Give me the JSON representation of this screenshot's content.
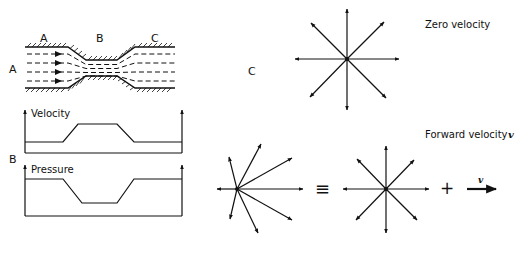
{
  "figure": {
    "panels": {
      "A": {
        "label": "A",
        "section_labels": [
          "A",
          "B",
          "C"
        ],
        "description": "Flow through a constricted channel with streamlines"
      },
      "B": {
        "label": "B",
        "plots": [
          {
            "title": "Velocity",
            "profile": "low-high-low"
          },
          {
            "title": "Pressure",
            "profile": "high-low-high"
          }
        ]
      },
      "C": {
        "label": "C",
        "zero_velocity_label": "Zero velocity",
        "forward_velocity_label": "Forward velocity",
        "velocity_symbol": "v",
        "equivalence_symbol": "≡",
        "plus_symbol": "+",
        "vector_arrow_label": "v"
      }
    }
  },
  "colors": {
    "ink": "#111111",
    "background": "#ffffff"
  }
}
